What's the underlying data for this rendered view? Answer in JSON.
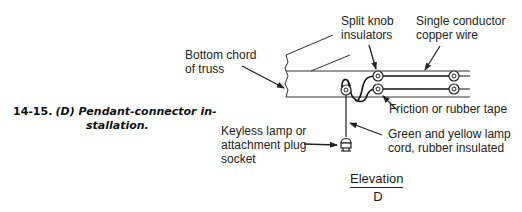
{
  "figure": {
    "number": "14-15.",
    "title_line1": "(D) Pendant-connector in-",
    "title_line2": "stallation.",
    "view_label": "Elevation",
    "view_letter": "D"
  },
  "labels": {
    "bottom_chord": [
      "Bottom chord",
      "of truss"
    ],
    "split_knob": [
      "Split knob",
      "insulators"
    ],
    "single_conductor": [
      "Single conductor",
      "copper wire"
    ],
    "friction_tape": [
      "Friction or rubber tape"
    ],
    "lamp_cord": [
      "Green and yellow lamp",
      "cord, rubber insulated"
    ],
    "keyless_lamp": [
      "Keyless lamp or",
      "attachment plug",
      "socket"
    ]
  },
  "colors": {
    "ink": "#222222",
    "background": "#ffffff"
  }
}
